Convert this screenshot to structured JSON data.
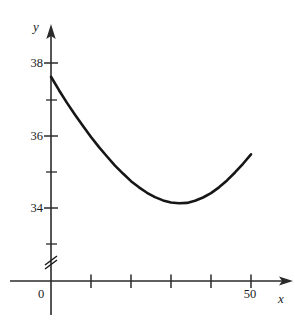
{
  "figure": {
    "background_color": "#ffffff",
    "line_color": "#161616",
    "axis_color": "#2b2b2b"
  },
  "axes": {
    "x_axis_label": "x",
    "y_axis_label": "y",
    "x_axis_has_arrow": true,
    "y_axis_has_arrow": true,
    "y_axis_break": true,
    "origin_label": "0"
  },
  "chart_data": {
    "type": "line",
    "title": "",
    "xlabel": "x",
    "ylabel": "y",
    "grid": false,
    "legend": null,
    "xlim": [
      0,
      57
    ],
    "ylim": [
      33.0,
      38.3
    ],
    "x_major_ticks": [
      0,
      10,
      20,
      30,
      40,
      50
    ],
    "x_tick_labels": [
      "0",
      "",
      "",
      "",
      "",
      "50"
    ],
    "y_major_ticks": [
      34,
      36,
      38
    ],
    "y_tick_labels": [
      "34",
      "36",
      "38"
    ],
    "y_minor_ticks": [
      33,
      35,
      37
    ],
    "axis_break_below": 33.0,
    "series": [
      {
        "name": "curve",
        "x": [
          0,
          2,
          4,
          6,
          8,
          10,
          12,
          14,
          16,
          18,
          20,
          22,
          24,
          26,
          28,
          30,
          32,
          34,
          36,
          38,
          40,
          42,
          44,
          46,
          48,
          50
        ],
        "y": [
          37.62,
          37.25,
          36.9,
          36.57,
          36.26,
          35.96,
          35.68,
          35.42,
          35.17,
          34.95,
          34.74,
          34.57,
          34.42,
          34.3,
          34.21,
          34.15,
          34.13,
          34.14,
          34.2,
          34.29,
          34.41,
          34.57,
          34.76,
          34.98,
          35.22,
          35.48
        ]
      }
    ],
    "annotations": [
      {
        "text": "38",
        "kind": "y-tick-label"
      },
      {
        "text": "36",
        "kind": "y-tick-label"
      },
      {
        "text": "34",
        "kind": "y-tick-label"
      },
      {
        "text": "0",
        "kind": "origin-label"
      },
      {
        "text": "50",
        "kind": "x-tick-label"
      },
      {
        "text": "x",
        "kind": "axis-name"
      },
      {
        "text": "y",
        "kind": "axis-name"
      }
    ]
  }
}
